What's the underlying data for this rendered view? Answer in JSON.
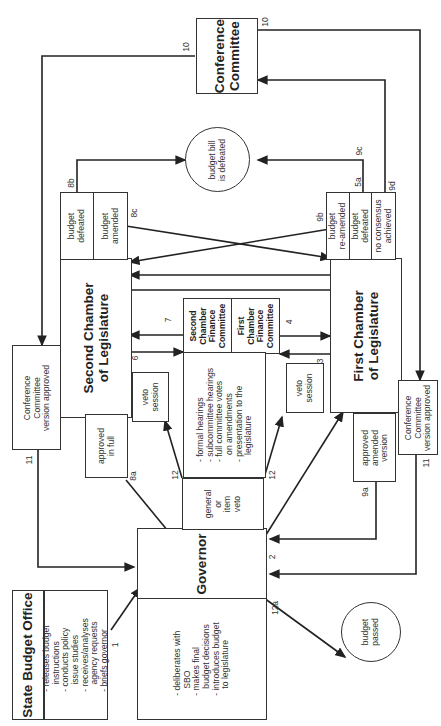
{
  "diagram": {
    "orientation": "rotated-90-ccw",
    "nodes": {
      "sbo_title": "State Budget Office",
      "sbo_tasks": "- releases budget\n   instructions\n- conducts policy\n   issue studies\n- receives/analyses\n   agency requests\n- briefs governor",
      "gov_title": "Governor",
      "gov_tasks": "- deliberates with\n   SBO\n- makes final\n   budget decisions\n- introduces budget\n   to legislature",
      "veto_type": "general\nor\nitem\nveto",
      "first_chamber": "First Chamber\nof Legislature",
      "second_chamber": "Second Chamber\nof Legislature",
      "second_finance": "Second\nChamber\nFinance\nCommittee",
      "first_finance": "First\nChamber\nFinance\nCommittee",
      "committee_tasks": "- formal hearings\n- subcommittee hearings\n- full committee votes\n   on amendments\n- presentation to the\n   legislature",
      "veto_session_first": "veto\nsession",
      "veto_session_second": "veto\nsession",
      "approved_in_full": "approved\nin full",
      "approved_amended": "approved\namended\nversion",
      "conf_approved_first": "Conference\nCommittee\nversion approved",
      "conf_approved_second": "Conference\nCommittee\nversion approved",
      "second_defeated": "budget\ndefeated",
      "second_amended": "budget\namended",
      "first_reamended": "budget\nre-amended",
      "first_defeated": "budget\ndefeated",
      "first_no_consensus": "no consensus\nachieved",
      "conference_committee": "Conference\nCommittee",
      "bill_defeated": "budget bill\nis defeated",
      "budget_passed": "budget\npassed"
    },
    "edge_labels": {
      "e1": "1",
      "e2": "2",
      "e3": "3",
      "e4": "4",
      "e5a": "5a",
      "e6": "6",
      "e7": "7",
      "e8a": "8a",
      "e8b": "8b",
      "e8c": "8c",
      "e9a": "9a",
      "e9b": "9b",
      "e9c": "9c",
      "e9d": "9d",
      "e10a": "10",
      "e10b": "10",
      "e11a": "11",
      "e11b": "11",
      "e12a": "12",
      "e12b": "12",
      "e12c": "12a"
    }
  }
}
